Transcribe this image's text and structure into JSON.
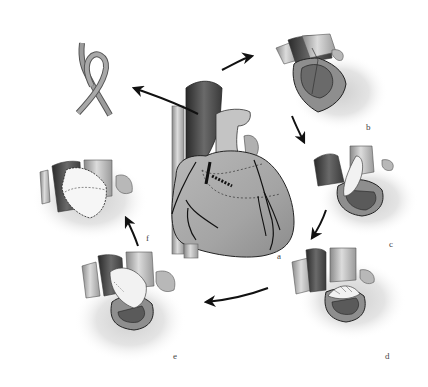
{
  "figure": {
    "type": "surgical-procedure-diagram",
    "panels": [
      {
        "id": "a",
        "label": "a",
        "content": "whole heart, anterior view with great vessels and coronary arteries"
      },
      {
        "id": "b",
        "label": "b",
        "content": "opened vessel/chamber showing incision"
      },
      {
        "id": "c",
        "label": "c",
        "content": "patch being placed into opening"
      },
      {
        "id": "d",
        "label": "d",
        "content": "patch sutured partially in place"
      },
      {
        "id": "e",
        "label": "e",
        "content": "patch further sewn along edge"
      },
      {
        "id": "f",
        "label": "f",
        "content": "completed patch with running suture"
      }
    ],
    "graft": {
      "name": "ribbon-graft",
      "content": "looped graft strip"
    },
    "arrows": [
      {
        "from": "a",
        "to": "graft"
      },
      {
        "from": "a",
        "to": "b"
      },
      {
        "from": "b",
        "to": "c"
      },
      {
        "from": "c",
        "to": "d"
      },
      {
        "from": "d",
        "to": "e"
      },
      {
        "from": "e",
        "to": "f"
      }
    ],
    "colors": {
      "tissue_light": "#c8c8c8",
      "tissue_mid": "#9a9a9a",
      "tissue_dark": "#3a3a3a",
      "patch": "#f4f4f4",
      "outline": "#2a2a2a",
      "background": "#ffffff"
    }
  }
}
